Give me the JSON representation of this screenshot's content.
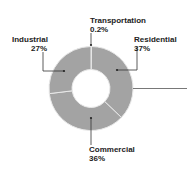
{
  "chart_data": {
    "type": "pie",
    "variant": "donut",
    "title": "",
    "categories": [
      "Transportation",
      "Residential",
      "Commercial",
      "Industrial"
    ],
    "values": [
      0.2,
      37,
      36,
      27
    ],
    "labels": [
      "0.2%",
      "37%",
      "36%",
      "27%"
    ],
    "start_angle_deg": 0,
    "direction": "clockwise",
    "slice_color": "#a3a3a3",
    "separator_color": "#e8e8e8",
    "legend": "none"
  },
  "labels": {
    "transportation": {
      "name": "Transportation",
      "value": "0.2%"
    },
    "residential": {
      "name": "Residential",
      "value": "37%"
    },
    "commercial": {
      "name": "Commercial",
      "value": "36%"
    },
    "industrial": {
      "name": "Industrial",
      "value": "27%"
    }
  }
}
